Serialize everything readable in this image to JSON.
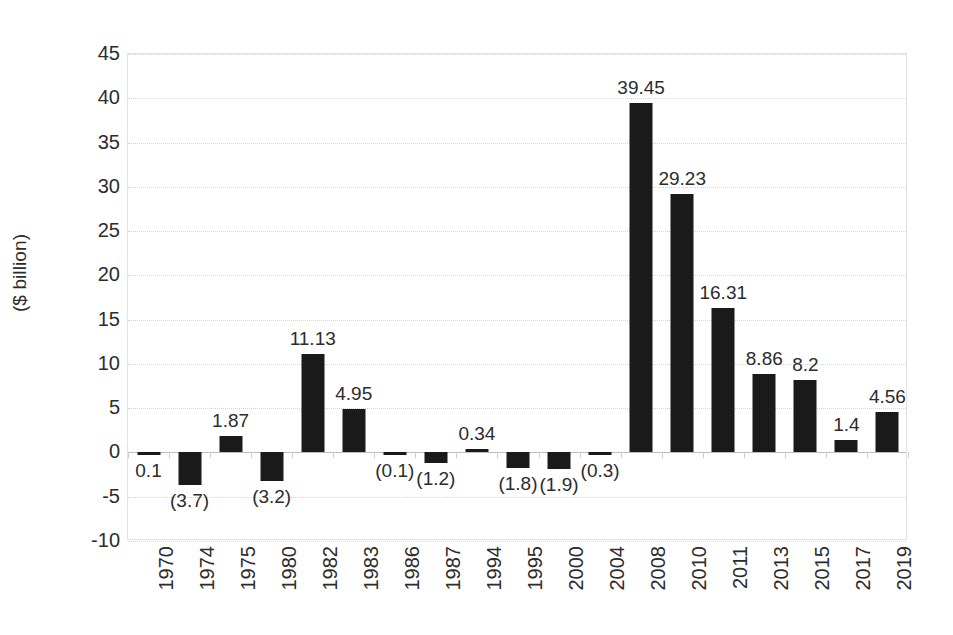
{
  "chart_data": {
    "type": "bar",
    "title": "",
    "subtitle": "",
    "xlabel": "",
    "ylabel": "($ billion)",
    "ylim": [
      -10,
      45
    ],
    "ytick_step": 5,
    "yticks": [
      45,
      40,
      35,
      30,
      25,
      20,
      15,
      10,
      5,
      0,
      -5,
      -10
    ],
    "ytick_labels": [
      "45",
      "40",
      "35",
      "30",
      "25",
      "20",
      "15",
      "10",
      "5",
      "0",
      "-5",
      "-10"
    ],
    "grid": true,
    "legend": null,
    "bar_color": "#1a1a1a",
    "negative_label_format": "parentheses",
    "categories": [
      "1970",
      "1974",
      "1975",
      "1980",
      "1982",
      "1983",
      "1986",
      "1987",
      "1994",
      "1995",
      "2000",
      "2004",
      "2008",
      "2010",
      "2011",
      "2013",
      "2015",
      "2017",
      "2019"
    ],
    "values": [
      -0.1,
      -3.7,
      1.87,
      -3.2,
      11.13,
      4.95,
      -0.1,
      -1.2,
      0.34,
      -1.8,
      -1.9,
      -0.3,
      39.45,
      29.23,
      16.31,
      8.86,
      8.2,
      1.4,
      4.56
    ],
    "data_labels": [
      "0.1",
      "(3.7)",
      "1.87",
      "(3.2)",
      "11.13",
      "4.95",
      "(0.1)",
      "(1.2)",
      "0.34",
      "(1.8)",
      "(1.9)",
      "(0.3)",
      "39.45",
      "29.23",
      "16.31",
      "8.86",
      "8.2",
      "1.4",
      "4.56"
    ]
  }
}
